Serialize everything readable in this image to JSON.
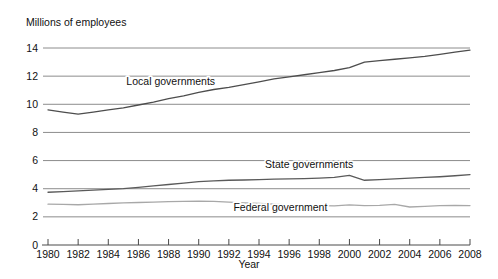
{
  "chart_data": {
    "type": "line",
    "title": "Millions of employees",
    "subtitle": "",
    "xlabel": "Year",
    "ylabel": "Millions of employees",
    "xlim": [
      1980,
      2008
    ],
    "ylim": [
      0,
      14
    ],
    "yticks": [
      0,
      2,
      4,
      6,
      8,
      10,
      12,
      14
    ],
    "ytick_labels": [
      "0",
      "2",
      "4",
      "6",
      "8",
      "10",
      "12",
      "14"
    ],
    "xticks": [
      1980,
      1982,
      1984,
      1986,
      1988,
      1990,
      1992,
      1994,
      1996,
      1998,
      2000,
      2002,
      2004,
      2006,
      2008
    ],
    "xtick_labels": [
      "1980",
      "1982",
      "1984",
      "1986",
      "1988",
      "1990",
      "1992",
      "1994",
      "1996",
      "1998",
      "2000",
      "2002",
      "2004",
      "2006",
      "2008"
    ],
    "grid": true,
    "grid_axis": "y",
    "legend": "inline-annotations",
    "x": [
      1980,
      1981,
      1982,
      1983,
      1984,
      1985,
      1986,
      1987,
      1988,
      1989,
      1990,
      1991,
      1992,
      1993,
      1994,
      1995,
      1996,
      1997,
      1998,
      1999,
      2000,
      2001,
      2002,
      2003,
      2004,
      2005,
      2006,
      2007,
      2008
    ],
    "series": [
      {
        "name": "Local governments",
        "color": "#4d4d4d",
        "label_x": 1985.2,
        "label_y": 11.35,
        "values": [
          9.6,
          9.45,
          9.3,
          9.45,
          9.6,
          9.75,
          9.95,
          10.15,
          10.4,
          10.6,
          10.85,
          11.05,
          11.2,
          11.4,
          11.6,
          11.8,
          11.95,
          12.1,
          12.25,
          12.4,
          12.6,
          13.0,
          13.1,
          13.2,
          13.3,
          13.4,
          13.55,
          13.7,
          13.85
        ]
      },
      {
        "name": "State governments",
        "color": "#5a5a5a",
        "label_x": 1994.4,
        "label_y": 5.45,
        "values": [
          3.75,
          3.8,
          3.85,
          3.9,
          3.95,
          4.0,
          4.1,
          4.2,
          4.3,
          4.4,
          4.5,
          4.55,
          4.6,
          4.62,
          4.65,
          4.68,
          4.7,
          4.72,
          4.75,
          4.8,
          4.95,
          4.6,
          4.65,
          4.7,
          4.75,
          4.8,
          4.85,
          4.92,
          5.0
        ]
      },
      {
        "name": "Federal government",
        "color": "#a8a8a8",
        "label_x": 1992.3,
        "label_y": 2.45,
        "values": [
          2.9,
          2.88,
          2.86,
          2.9,
          2.95,
          3.0,
          3.02,
          3.05,
          3.08,
          3.1,
          3.12,
          3.1,
          3.05,
          3.0,
          2.95,
          2.9,
          2.85,
          2.82,
          2.8,
          2.78,
          2.85,
          2.8,
          2.82,
          2.88,
          2.7,
          2.75,
          2.8,
          2.82,
          2.8
        ]
      }
    ]
  }
}
